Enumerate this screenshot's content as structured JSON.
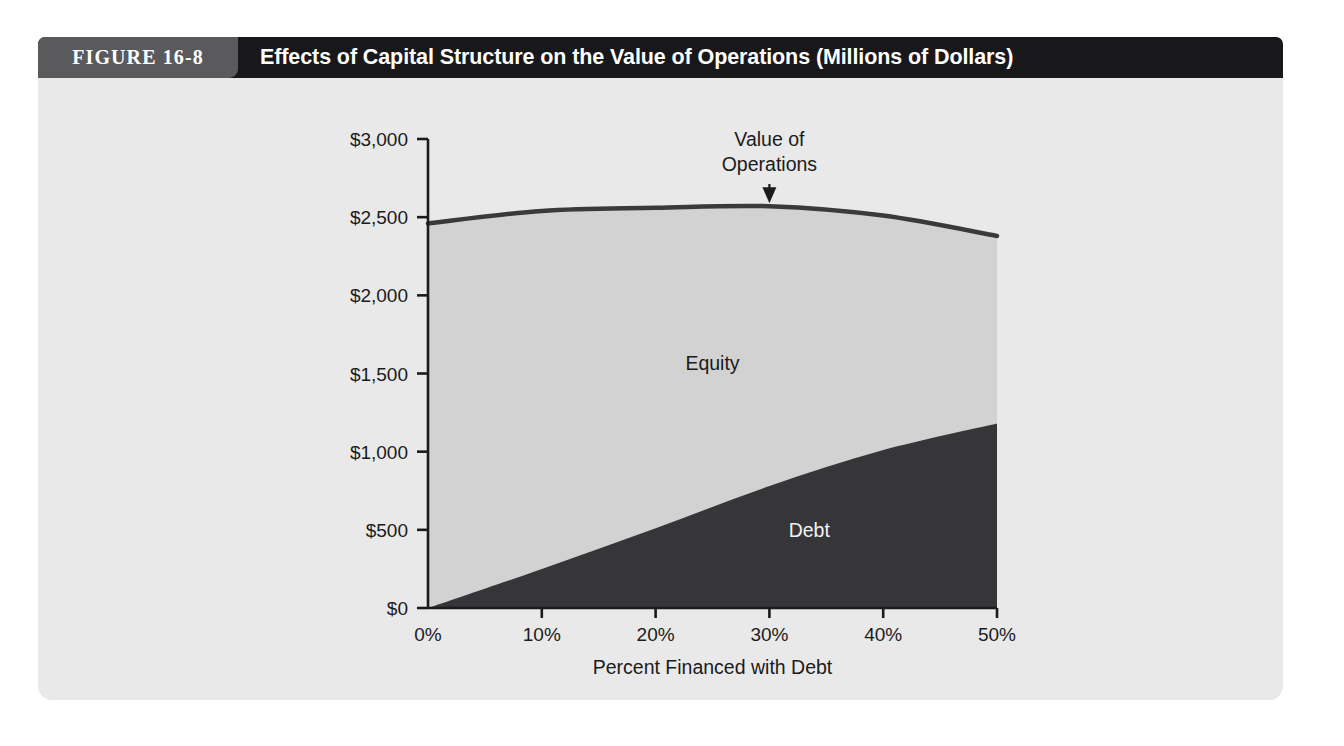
{
  "figure": {
    "number_label": "FIGURE 16-8",
    "title": "Effects of Capital Structure on the Value of Operations (Millions of Dollars)",
    "header_bg": "#18181a",
    "number_box_bg": "#5a5a5c",
    "panel_bg": "#e9e9e9"
  },
  "chart_data": {
    "type": "area",
    "title": "Effects of Capital Structure on the Value of Operations (Millions of Dollars)",
    "xlabel": "Percent Financed with Debt",
    "ylabel": "",
    "x": [
      0,
      10,
      20,
      30,
      40,
      50
    ],
    "xlim": [
      0,
      50
    ],
    "ylim": [
      0,
      3000
    ],
    "xtick_labels": [
      "0%",
      "10%",
      "20%",
      "30%",
      "40%",
      "50%"
    ],
    "ytick_labels": [
      "$0",
      "$500",
      "$1,000",
      "$1,500",
      "$2,000",
      "$2,500",
      "$3,000"
    ],
    "ytick_values": [
      0,
      500,
      1000,
      1500,
      2000,
      2500,
      3000
    ],
    "grid": false,
    "legend_position": "inline-annotations",
    "series": [
      {
        "name": "Debt",
        "values": [
          0,
          250,
          510,
          780,
          1010,
          1180
        ],
        "color": "#363639",
        "label_text": "Debt",
        "label_color": "#f2f2f2"
      },
      {
        "name": "Equity",
        "values": [
          2460,
          2290,
          2050,
          1790,
          1500,
          1200
        ],
        "color": "#d2d2d2",
        "label_text": "Equity",
        "label_color": "#1b1b1b"
      },
      {
        "name": "Value of Operations",
        "values": [
          2460,
          2540,
          2560,
          2570,
          2510,
          2380
        ],
        "color": "#3a3a3c",
        "label_text": "Value of Operations",
        "label_color": "#1b1b1b"
      }
    ],
    "annotations": [
      {
        "text_line_1": "Value of",
        "text_line_2": "Operations",
        "points_to_x": 30,
        "points_to_y": 2570
      }
    ]
  }
}
